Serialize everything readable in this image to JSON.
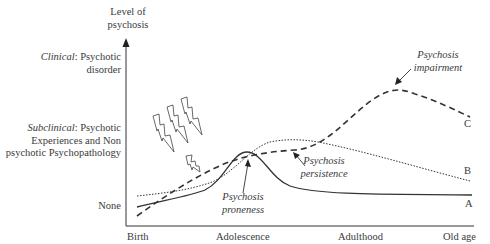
{
  "diagram": {
    "y_axis": {
      "title_line1": "Level of",
      "title_line2": "psychosis",
      "levels": {
        "clinical_term": "Clinical",
        "clinical_rest": ": Psychotic",
        "clinical_line2": "disorder",
        "subclinical_term": "Subclinical",
        "subclinical_rest": ": Psychotic",
        "subclinical_line2": "Experiences and Non",
        "subclinical_line3": "psychotic Psychopathology",
        "none": "None"
      }
    },
    "x_axis": {
      "ticks": [
        "Birth",
        "Adolescence",
        "Adulthood",
        "Old age"
      ]
    },
    "curves": [
      {
        "id": "A",
        "label": "A",
        "style": "solid",
        "description": "Psychosis proneness"
      },
      {
        "id": "B",
        "label": "B",
        "style": "dotted",
        "description": "Psychosis persistence"
      },
      {
        "id": "C",
        "label": "C",
        "style": "dashed",
        "description": "Psychosis impairment"
      }
    ],
    "annotations": {
      "impairment_line1": "Psychosis",
      "impairment_line2": "impairment",
      "persistence_line1": "Psychosis",
      "persistence_line2": "persistence",
      "proneness_line1": "Psychosis",
      "proneness_line2": "proneness"
    },
    "icons": [
      "lightning-bolt-icon",
      "lightning-bolt-icon",
      "lightning-bolt-icon",
      "small-lightning-bolt-icon"
    ],
    "colors": {
      "line": "#333333",
      "text": "#3a3a3a",
      "background": "#ffffff"
    }
  }
}
